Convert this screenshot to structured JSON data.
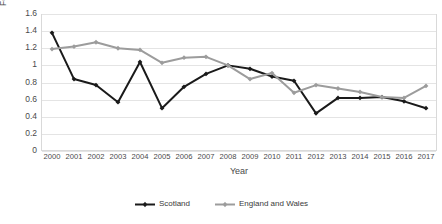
{
  "chart_data": {
    "type": "line",
    "title": "",
    "xlabel": "Year",
    "ylabel": "Female homicide rate",
    "categories": [
      2000,
      2001,
      2002,
      2003,
      2004,
      2005,
      2006,
      2007,
      2008,
      2009,
      2010,
      2011,
      2012,
      2013,
      2014,
      2015,
      2016,
      2017
    ],
    "x": [
      "2000",
      "2001",
      "2002",
      "2003",
      "2004",
      "2005",
      "2006",
      "2007",
      "2008",
      "2009",
      "2010",
      "2011",
      "2012",
      "2013",
      "2014",
      "2015",
      "2016",
      "2017"
    ],
    "ylim": [
      0,
      1.6
    ],
    "ytick_values": [
      0,
      0.2,
      0.4,
      0.6,
      0.8,
      1,
      1.2,
      1.4,
      1.6
    ],
    "yticks": [
      "0",
      "0.2",
      "0.4",
      "0.6",
      "0.8",
      "1",
      "1.2",
      "1.4",
      "1.6"
    ],
    "grid": true,
    "legend_position": "bottom",
    "series": [
      {
        "name": "Scotland",
        "color": "#1a1a1a",
        "marker": "diamond",
        "values": [
          1.38,
          0.84,
          0.77,
          0.57,
          1.04,
          0.5,
          0.75,
          0.9,
          1.0,
          0.96,
          0.87,
          0.82,
          0.44,
          0.62,
          0.62,
          0.63,
          0.58,
          0.5
        ]
      },
      {
        "name": "England and Wales",
        "color": "#9c9c9c",
        "marker": "diamond",
        "values": [
          1.19,
          1.22,
          1.27,
          1.2,
          1.18,
          1.03,
          1.09,
          1.1,
          1.0,
          0.84,
          0.91,
          0.68,
          0.77,
          0.73,
          0.69,
          0.63,
          0.62,
          0.76
        ]
      }
    ]
  },
  "legend": {
    "items": [
      {
        "label": "Scotland"
      },
      {
        "label": "England and Wales"
      }
    ]
  },
  "axes": {
    "x_title": "Year",
    "y_title": "Female homicide rate"
  }
}
